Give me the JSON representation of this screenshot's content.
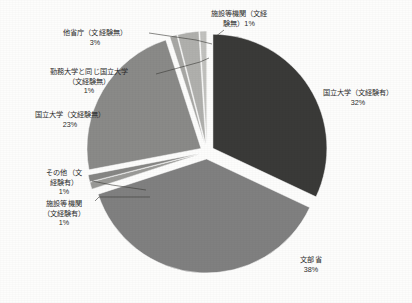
{
  "chart_data": {
    "type": "pie",
    "title": "",
    "subtitle": "",
    "xlabel": "",
    "ylabel": "",
    "legend_position": "none",
    "grid": false,
    "exploded": true,
    "start_angle_deg": 0,
    "labels_show_percent": true,
    "categories": [
      "国立大学（文経験有）",
      "文部省",
      "施設等機関（文経験有）",
      "その他（文経験有）",
      "国立大学（文経験無）",
      "勤務大学と同じ国立大学（文経験無）",
      "他省庁（文経験無）",
      "施設等機関（文経験無）"
    ],
    "values": [
      32,
      38,
      1,
      1,
      23,
      1,
      3,
      1
    ],
    "value_labels": [
      "32%",
      "38%",
      "1%",
      "1%",
      "23%",
      "1%",
      "3%",
      "1%"
    ],
    "colors": [
      "#3a3a38",
      "#808080",
      "#9a9a97",
      "#868684",
      "#8a8a88",
      "#a8a8a5",
      "#b0b0ad",
      "#c2c2bf"
    ],
    "total": 100
  },
  "slices": [
    {
      "id": "kokuritsu-yu",
      "name": "国立大学（文経験有）",
      "value": "32%",
      "color": "#3a3a38",
      "start": 0,
      "end": 115.2
    },
    {
      "id": "monbusho",
      "name": "文部省",
      "value": "38%",
      "color": "#808080",
      "start": 115.2,
      "end": 252.0
    },
    {
      "id": "shisetsu-yu",
      "name": "施設等機関（文経験有）",
      "value": "1%",
      "color": "#9a9a97",
      "start": 252.0,
      "end": 255.6
    },
    {
      "id": "sonota-yu",
      "name": "その他（文経験有）",
      "value": "1%",
      "color": "#868684",
      "start": 255.6,
      "end": 259.2
    },
    {
      "id": "kokuritsu-mu",
      "name": "国立大学（文経験無）",
      "value": "23%",
      "color": "#8a8a88",
      "start": 259.2,
      "end": 342.0
    },
    {
      "id": "kinmu-daigaku",
      "name": "勤務大学と同じ国立大学（文経験無）",
      "value": "1%",
      "color": "#a8a8a5",
      "start": 342.0,
      "end": 345.6
    },
    {
      "id": "tashocho",
      "name": "他省庁（文経験無）",
      "value": "3%",
      "color": "#b0b0ad",
      "start": 345.6,
      "end": 356.4
    },
    {
      "id": "shisetsu-mu",
      "name": "施設等機関（文経験無）",
      "value": "1%",
      "color": "#c2c2bf",
      "start": 356.4,
      "end": 360.0
    }
  ],
  "labels": {
    "shisetsu_mu": {
      "line1": "施設等機関（文経",
      "line2": "験無）1%"
    },
    "tashocho": {
      "name": "他省庁（文経験無）",
      "value": "3%"
    },
    "kinmu_daigaku": {
      "line1": "勤務大学と同じ国立大学",
      "line2": "（文経験無）",
      "value": "1%"
    },
    "kokuritsu_mu": {
      "name": "国立大学（文経験無）",
      "value": "23%"
    },
    "sonota_yu": {
      "line1": "その他（文",
      "line2": "経験有）",
      "value": "1%"
    },
    "shisetsu_yu": {
      "line1": "施設等機関",
      "line2": "（文経験有）",
      "value": "1%"
    },
    "kokuritsu_yu": {
      "name": "国立大学（文経験有）",
      "value": "32%"
    },
    "monbusho": {
      "name": "文部省",
      "value": "38%"
    }
  }
}
